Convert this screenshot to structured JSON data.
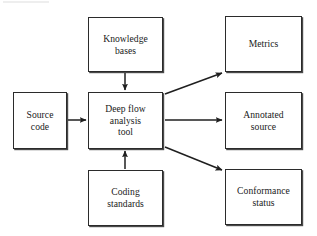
{
  "diagram": {
    "type": "block-flow-diagram",
    "background_color": "#ffffff",
    "line_color": "#2b2b2b",
    "text_color": "#1a1a1a",
    "nodes": [
      {
        "id": "source-code",
        "label": "Source\ncode",
        "x": 13,
        "y": 92,
        "width": 54,
        "height": 57
      },
      {
        "id": "knowledge-bases",
        "label": "Knowledge\nbases",
        "x": 88,
        "y": 17,
        "width": 75,
        "height": 55
      },
      {
        "id": "deep-flow-analysis-tool",
        "label": "Deep flow\nanalysis\ntool",
        "x": 88,
        "y": 92,
        "width": 75,
        "height": 57
      },
      {
        "id": "coding-standards",
        "label": "Coding\nstandards",
        "x": 88,
        "y": 170,
        "width": 75,
        "height": 56
      },
      {
        "id": "metrics",
        "label": "Metrics",
        "x": 225,
        "y": 16,
        "width": 77,
        "height": 56
      },
      {
        "id": "annotated-source",
        "label": "Annotated\nsource",
        "x": 225,
        "y": 92,
        "width": 77,
        "height": 57
      },
      {
        "id": "conformance-status",
        "label": "Conformance\nstatus",
        "x": 225,
        "y": 169,
        "width": 77,
        "height": 56
      }
    ],
    "edges": [
      {
        "id": "source-code-to-tool",
        "from": "source-code",
        "to": "deep-flow-analysis-tool",
        "x1": 68,
        "y1": 120,
        "x2": 86,
        "y2": 120
      },
      {
        "id": "knowledge-bases-to-tool",
        "from": "knowledge-bases",
        "to": "deep-flow-analysis-tool",
        "x1": 125,
        "y1": 73,
        "x2": 125,
        "y2": 90
      },
      {
        "id": "coding-standards-to-tool",
        "from": "coding-standards",
        "to": "deep-flow-analysis-tool",
        "x1": 125,
        "y1": 169,
        "x2": 125,
        "y2": 151
      },
      {
        "id": "tool-to-metrics",
        "from": "deep-flow-analysis-tool",
        "to": "metrics",
        "x1": 165,
        "y1": 94,
        "x2": 222,
        "y2": 73
      },
      {
        "id": "tool-to-annotated-source",
        "from": "deep-flow-analysis-tool",
        "to": "annotated-source",
        "x1": 165,
        "y1": 120,
        "x2": 222,
        "y2": 120
      },
      {
        "id": "tool-to-conformance-status",
        "from": "deep-flow-analysis-tool",
        "to": "conformance-status",
        "x1": 165,
        "y1": 147,
        "x2": 222,
        "y2": 170
      }
    ]
  }
}
